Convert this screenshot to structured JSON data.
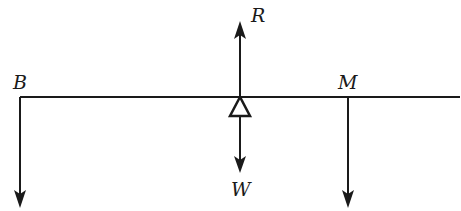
{
  "diagram": {
    "type": "free-body-diagram",
    "colors": {
      "stroke": "#1a1a1a",
      "background": "#ffffff"
    },
    "beam": {
      "x1": 20,
      "x2": 460,
      "y": 97
    },
    "pivot": {
      "x": 240,
      "y": 97,
      "shape": "triangle"
    },
    "labels": {
      "B": "B",
      "M": "M",
      "R": "R",
      "W": "W"
    },
    "forces": [
      {
        "name": "B",
        "direction": "down",
        "x": 20,
        "from_y": 97,
        "to_y": 207
      },
      {
        "name": "R",
        "direction": "up",
        "x": 240,
        "from_y": 97,
        "to_y": 22
      },
      {
        "name": "W",
        "direction": "down",
        "x": 240,
        "from_y": 117,
        "to_y": 172
      },
      {
        "name": "M",
        "direction": "down",
        "x": 348,
        "from_y": 97,
        "to_y": 207
      }
    ]
  }
}
